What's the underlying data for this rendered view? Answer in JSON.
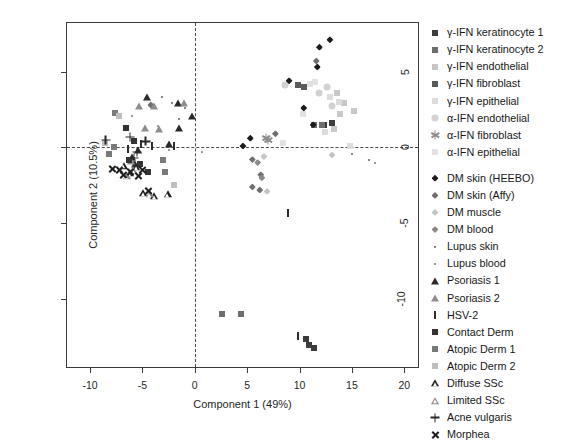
{
  "chart_data": {
    "type": "scatter",
    "title": "",
    "xlabel": "Component 1 (49%)",
    "ylabel": "Component 2 (10.5%)",
    "xlim": [
      -12.2,
      21.5
    ],
    "ylim": [
      -14.6,
      8.2
    ],
    "xticks": [
      -10,
      -5,
      0,
      5,
      10,
      15,
      20
    ],
    "xticklabels": [
      "-10",
      "-5",
      "0",
      "5",
      "10",
      "15",
      "20"
    ],
    "yticks": [
      5,
      0,
      -5,
      -10
    ],
    "yticklabels": [
      "5",
      "0",
      "-5",
      "-10"
    ],
    "grid": false,
    "reference_lines": {
      "horizontal": 0,
      "vertical": 0,
      "style": "dashed"
    },
    "legend_position": "right-outside",
    "series": [
      {
        "name": "γ-IFN keratinocyte 1",
        "marker": "square",
        "color": "#3c3c3c",
        "points": [
          [
            13.1,
            1.6
          ],
          [
            12.3,
            1.5
          ],
          [
            10.9,
            -13.0
          ],
          [
            10.6,
            -12.6
          ],
          [
            11.4,
            -13.2
          ]
        ]
      },
      {
        "name": "γ-IFN keratinocyte 2",
        "marker": "square",
        "color": "#6e6e6e",
        "points": [
          [
            11.4,
            1.5
          ],
          [
            12.1,
            1.5
          ],
          [
            2.6,
            -11.0
          ],
          [
            4.4,
            -11.0
          ]
        ]
      },
      {
        "name": "γ-IFN endothelial",
        "marker": "square",
        "color": "#c8c8c8",
        "points": [
          [
            13.6,
            3.6
          ],
          [
            14.2,
            2.9
          ],
          [
            13.9,
            2.2
          ],
          [
            15.2,
            2.4
          ],
          [
            13.3,
            1.2
          ]
        ]
      },
      {
        "name": "γ-IFN fibroblast",
        "marker": "square",
        "color": "#5a5a5a",
        "points": [
          [
            9.9,
            4.1
          ],
          [
            10.4,
            4.0
          ]
        ]
      },
      {
        "name": "γ-IFN epithelial",
        "marker": "square",
        "color": "#dcdcdc",
        "points": [
          [
            12.9,
            3.3
          ],
          [
            13.8,
            3.0
          ],
          [
            12.4,
            1.0
          ],
          [
            14.8,
            0.1
          ]
        ]
      },
      {
        "name": "α-IFN endothelial",
        "marker": "circle",
        "color": "#d2d2d2",
        "points": [
          [
            11.9,
            3.6
          ],
          [
            12.6,
            4.0
          ],
          [
            13.1,
            2.7
          ],
          [
            8.6,
            4.1
          ]
        ]
      },
      {
        "name": "α-IFN fibroblast",
        "marker": "star",
        "color": "#8c8c8c",
        "points": [
          [
            6.8,
            0.6
          ],
          [
            7.0,
            0.5
          ]
        ]
      },
      {
        "name": "α-IFN epithelial",
        "marker": "square",
        "color": "#e2e2e2",
        "points": [
          [
            11.5,
            4.3
          ],
          [
            11.0,
            4.2
          ],
          [
            10.3,
            2.2
          ],
          [
            8.4,
            0.3
          ]
        ]
      },
      {
        "name": "DM skin (HEEBO)",
        "marker": "diamond",
        "color": "#1c1c1c",
        "points": [
          [
            11.9,
            6.6
          ],
          [
            12.9,
            7.1
          ],
          [
            11.7,
            5.3
          ],
          [
            9.0,
            4.4
          ],
          [
            10.4,
            2.6
          ],
          [
            11.3,
            1.5
          ],
          [
            5.3,
            0.6
          ],
          [
            4.6,
            0.1
          ]
        ]
      },
      {
        "name": "DM skin (Affy)",
        "marker": "diamond",
        "color": "#707070",
        "points": [
          [
            11.6,
            5.7
          ],
          [
            7.7,
            0.9
          ],
          [
            5.5,
            -0.8
          ],
          [
            6.3,
            -1.8
          ],
          [
            5.5,
            -2.6
          ],
          [
            6.2,
            -2.8
          ],
          [
            -4.2,
            2.8
          ]
        ]
      },
      {
        "name": "DM muscle",
        "marker": "diamond",
        "color": "#c4c4c4",
        "points": [
          [
            6.6,
            -0.6
          ],
          [
            6.9,
            -2.9
          ],
          [
            13.1,
            -0.5
          ]
        ]
      },
      {
        "name": "DM blood",
        "marker": "diamond",
        "color": "#8a8a8a",
        "points": [
          [
            6.0,
            -1.0
          ],
          [
            6.4,
            -2.0
          ]
        ]
      },
      {
        "name": "Lupus skin",
        "marker": "dot",
        "color": "#888888",
        "points": [
          [
            -2.2,
            2.9
          ],
          [
            -0.9,
            2.6
          ],
          [
            -1.5,
            1.9
          ],
          [
            -3.1,
            3.3
          ],
          [
            16.6,
            -0.8
          ],
          [
            15.0,
            -0.4
          ]
        ]
      },
      {
        "name": "Lupus blood",
        "marker": "dot",
        "color": "#9a9a9a",
        "points": [
          [
            -6.0,
            2.1
          ],
          [
            -3.5,
            1.4
          ],
          [
            0.7,
            -0.3
          ],
          [
            -2.5,
            -0.2
          ],
          [
            17.2,
            -1.0
          ]
        ]
      },
      {
        "name": "Psoriasis 1",
        "marker": "triangle",
        "color": "#2a2a2a",
        "points": [
          [
            -4.6,
            3.3
          ],
          [
            -1.6,
            2.9
          ],
          [
            -0.3,
            2.1
          ],
          [
            -1.5,
            1.3
          ],
          [
            -2.5,
            0.2
          ],
          [
            -5.4,
            -0.2
          ],
          [
            -6.0,
            -0.6
          ],
          [
            -5.7,
            -1.1
          ]
        ]
      },
      {
        "name": "Psoriasis 2",
        "marker": "triangle",
        "color": "#8e8e8e",
        "points": [
          [
            -5.3,
            2.7
          ],
          [
            -3.9,
            2.7
          ],
          [
            -3.4,
            1.2
          ],
          [
            -4.8,
            1.3
          ],
          [
            -1.0,
            2.9
          ],
          [
            -6.1,
            -0.9
          ]
        ]
      },
      {
        "name": "HSV-2",
        "marker": "vbar",
        "color": "#2c2c2c",
        "points": [
          [
            -5.1,
            0.2
          ],
          [
            -4.1,
            0.1
          ],
          [
            -2.0,
            0.1
          ],
          [
            -6.4,
            -0.1
          ],
          [
            8.9,
            -4.3
          ],
          [
            9.9,
            -12.4
          ]
        ]
      },
      {
        "name": "Contact Derm",
        "marker": "square",
        "color": "#333333",
        "points": [
          [
            -5.8,
            0.4
          ],
          [
            -6.3,
            -0.8
          ],
          [
            -5.2,
            -1.1
          ],
          [
            -4.5,
            -1.6
          ],
          [
            -6.6,
            1.3
          ]
        ]
      },
      {
        "name": "Atopic Derm 1",
        "marker": "square",
        "color": "#7a7a7a",
        "points": [
          [
            -7.6,
            2.3
          ],
          [
            -3.0,
            -0.8
          ],
          [
            -2.8,
            -1.6
          ],
          [
            -7.7,
            0.0
          ],
          [
            -8.2,
            -0.4
          ]
        ]
      },
      {
        "name": "Atopic Derm 2",
        "marker": "square",
        "color": "#bfbfbf",
        "points": [
          [
            -2.0,
            -2.5
          ],
          [
            -8.6,
            0.3
          ],
          [
            -7.2,
            2.1
          ]
        ]
      },
      {
        "name": "Diffuse SSc",
        "marker": "triangle-open",
        "color": "#1f1f1f",
        "points": [
          [
            -4.9,
            -3.0
          ],
          [
            -3.9,
            -3.2
          ],
          [
            -2.6,
            -3.1
          ],
          [
            -5.6,
            -1.3
          ],
          [
            -6.2,
            -1.7
          ],
          [
            -6.8,
            -1.2
          ]
        ]
      },
      {
        "name": "Limited SSc",
        "marker": "triangle-open",
        "color": "#8a8a8a",
        "points": [
          [
            -4.3,
            -3.1
          ],
          [
            -5.9,
            -1.5
          ],
          [
            -6.5,
            -1.9
          ]
        ]
      },
      {
        "name": "Acne vulgaris",
        "marker": "plus",
        "color": "#262626",
        "points": [
          [
            -8.5,
            0.5
          ],
          [
            -6.2,
            0.7
          ],
          [
            -5.5,
            -0.3
          ],
          [
            -5.8,
            -0.7
          ],
          [
            -4.7,
            0.4
          ]
        ]
      },
      {
        "name": "Morphea",
        "marker": "cross",
        "color": "#1e1e1e",
        "points": [
          [
            -7.9,
            -1.4
          ],
          [
            -7.2,
            -1.5
          ],
          [
            -6.8,
            -1.8
          ],
          [
            -6.2,
            -1.6
          ],
          [
            -5.4,
            -1.9
          ],
          [
            -5.0,
            -1.5
          ],
          [
            -4.4,
            -2.9
          ]
        ]
      }
    ]
  },
  "legend": {
    "groups": [
      {
        "items": [
          {
            "label": "γ-IFN keratinocyte 1",
            "marker": "square",
            "color": "#3c3c3c"
          },
          {
            "label": "γ-IFN keratinocyte 2",
            "marker": "square",
            "color": "#6e6e6e"
          },
          {
            "label": "γ-IFN endothelial",
            "marker": "square",
            "color": "#c8c8c8"
          },
          {
            "label": "γ-IFN fibroblast",
            "marker": "square",
            "color": "#5a5a5a"
          },
          {
            "label": "γ-IFN epithelial",
            "marker": "square",
            "color": "#dcdcdc"
          },
          {
            "label": "α-IFN endothelial",
            "marker": "circle",
            "color": "#d2d2d2"
          },
          {
            "label": "α-IFN fibroblast",
            "marker": "star",
            "color": "#8c8c8c"
          },
          {
            "label": "α-IFN epithelial",
            "marker": "square",
            "color": "#e2e2e2"
          }
        ]
      },
      {
        "items": [
          {
            "label": "DM skin (HEEBO)",
            "marker": "diamond",
            "color": "#1c1c1c"
          },
          {
            "label": "DM skin (Affy)",
            "marker": "diamond",
            "color": "#707070"
          },
          {
            "label": "DM muscle",
            "marker": "diamond",
            "color": "#c4c4c4"
          },
          {
            "label": "DM blood",
            "marker": "diamond",
            "color": "#8a8a8a"
          },
          {
            "label": "Lupus skin",
            "marker": "dot",
            "color": "#888888"
          },
          {
            "label": "Lupus blood",
            "marker": "dot",
            "color": "#9a9a9a"
          },
          {
            "label": "Psoriasis 1",
            "marker": "triangle",
            "color": "#2a2a2a"
          },
          {
            "label": "Psoriasis 2",
            "marker": "triangle",
            "color": "#8e8e8e"
          },
          {
            "label": "HSV-2",
            "marker": "vbar",
            "color": "#2c2c2c"
          },
          {
            "label": "Contact Derm",
            "marker": "square",
            "color": "#333333"
          },
          {
            "label": "Atopic Derm 1",
            "marker": "square",
            "color": "#7a7a7a"
          },
          {
            "label": "Atopic Derm 2",
            "marker": "square",
            "color": "#bfbfbf"
          },
          {
            "label": "Diffuse SSc",
            "marker": "triangle-open",
            "color": "#1f1f1f"
          },
          {
            "label": "Limited SSc",
            "marker": "triangle-open",
            "color": "#8a8a8a"
          },
          {
            "label": "Acne vulgaris",
            "marker": "plus",
            "color": "#262626"
          },
          {
            "label": "Morphea",
            "marker": "cross",
            "color": "#1e1e1e"
          }
        ]
      }
    ]
  }
}
